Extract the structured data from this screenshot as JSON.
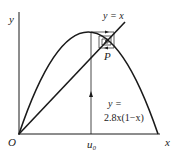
{
  "diagram": {
    "axes": {
      "x_label": "x",
      "y_label": "y",
      "origin_label": "O"
    },
    "curves": {
      "parabola_label_line1": "y =",
      "parabola_label_line2": "2.8x(1−x)",
      "diagonal_label": "y = x"
    },
    "points": {
      "fixed_point_label": "P",
      "start_label": "u₀"
    },
    "colors": {
      "stroke": "#1a1a1a",
      "background": "#ffffff"
    }
  }
}
